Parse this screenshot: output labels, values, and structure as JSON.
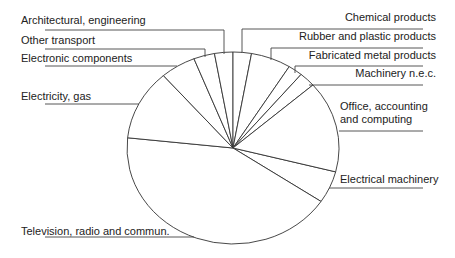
{
  "chart_data": {
    "type": "pie",
    "title": "",
    "start_angle_deg": 14.4,
    "direction": "clockwise",
    "center": [
      233,
      148
    ],
    "radii": [
      106,
      96
    ],
    "categories": [
      "Electrical machinery",
      "Television, radio and commun.",
      "Electricity, gas",
      "Electronic components",
      "Other transport",
      "Architectural, engineering",
      "Chemical products",
      "Rubber and plastic products",
      "Fabricated metal products",
      "Machinery n.e.c.",
      "Office, accounting and computing"
    ],
    "values": [
      5.4,
      42.3,
      11.9,
      5.4,
      3.2,
      2.8,
      2.8,
      6.1,
      2.2,
      2.5,
      15.4
    ],
    "legend": "leader-line labels",
    "fill": "#ffffff",
    "stroke": "#333333"
  },
  "labels": [
    {
      "text": "Architectural, engineering",
      "x": 21,
      "y": 14,
      "align": "left",
      "line": [
        [
          45,
          30
        ],
        [
          224,
          30
        ],
        [
          224,
          54
        ]
      ]
    },
    {
      "text": "Other transport",
      "x": 21,
      "y": 34,
      "align": "left",
      "line": [
        [
          45,
          49
        ],
        [
          205,
          49
        ],
        [
          205,
          57
        ]
      ]
    },
    {
      "text": "Electronic components",
      "x": 21,
      "y": 52,
      "align": "left",
      "line": [
        [
          45,
          66
        ],
        [
          177,
          66
        ]
      ]
    },
    {
      "text": "Electricity, gas",
      "x": 21,
      "y": 90,
      "align": "left",
      "line": [
        [
          45,
          104
        ],
        [
          139,
          104
        ]
      ]
    },
    {
      "text": "Television, radio and commun.",
      "x": 21,
      "y": 225,
      "align": "left",
      "line": [
        [
          45,
          237
        ],
        [
          194,
          237
        ]
      ]
    },
    {
      "text": "Chemical products",
      "x": 300,
      "y": 11,
      "align": "right",
      "w": 136,
      "line": [
        [
          423,
          29
        ],
        [
          242,
          29
        ],
        [
          242,
          53
        ]
      ]
    },
    {
      "text": "Rubber and plastic products",
      "x": 280,
      "y": 30,
      "align": "right",
      "w": 156,
      "line": [
        [
          423,
          48
        ],
        [
          271,
          48
        ],
        [
          271,
          60
        ]
      ]
    },
    {
      "text": "Fabricated metal products",
      "x": 290,
      "y": 49,
      "align": "right",
      "w": 146,
      "line": [
        [
          423,
          66
        ],
        [
          295,
          66
        ],
        [
          295,
          73
        ]
      ]
    },
    {
      "text": "Machinery n.e.c.",
      "x": 330,
      "y": 67,
      "align": "right",
      "w": 106,
      "line": [
        [
          423,
          85
        ],
        [
          309,
          85
        ]
      ]
    },
    {
      "text": "Office, accounting\nand computing",
      "x": 340,
      "y": 100,
      "align": "left",
      "line": [
        [
          423,
          131
        ],
        [
          339,
          131
        ]
      ]
    },
    {
      "text": "Electrical machinery",
      "x": 340,
      "y": 173,
      "align": "left",
      "line": [
        [
          423,
          188
        ],
        [
          329,
          188
        ]
      ]
    }
  ]
}
